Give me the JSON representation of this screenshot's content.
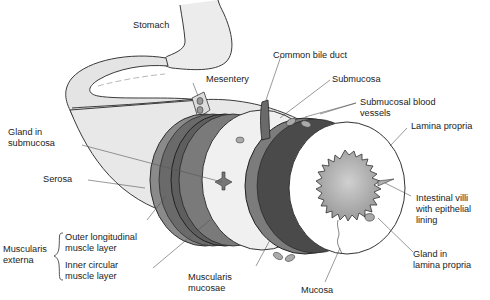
{
  "diagram": {
    "colors": {
      "outline": "#3a3a3a",
      "serosa": "#e6e6e6",
      "muscle_outer": "#8a8a8a",
      "muscle_inner": "#5e5e5e",
      "submucosa": "#efefef",
      "lumen": "#a9a9a9",
      "leader": "#555555"
    },
    "labels": {
      "stomach": "Stomach",
      "mesentery": "Mesentery",
      "common_bile_duct": "Common bile duct",
      "submucosa": "Submucosa",
      "submucosal_blood_vessels_1": "Submucosal blood",
      "submucosal_blood_vessels_2": "vessels",
      "lamina_propria": "Lamina propria",
      "gland_submucosa_1": "Gland in",
      "gland_submucosa_2": "submucosa",
      "serosa": "Serosa",
      "muscularis_externa_1": "Muscularis",
      "muscularis_externa_2": "externa",
      "outer_longitudinal_1": "Outer longitudinal",
      "outer_longitudinal_2": "muscle layer",
      "inner_circular_1": "Inner circular",
      "inner_circular_2": "muscle layer",
      "muscularis_mucosae_1": "Muscularis",
      "muscularis_mucosae_2": "mucosae",
      "mucosa": "Mucosa",
      "intestinal_villi_1": "Intestinal villi",
      "intestinal_villi_2": "with epithelial",
      "intestinal_villi_3": "lining",
      "gland_lamina_1": "Gland in",
      "gland_lamina_2": "lamina propria"
    }
  }
}
